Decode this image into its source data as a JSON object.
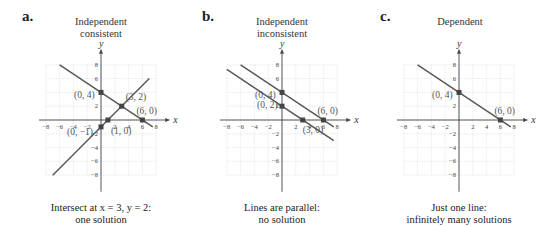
{
  "panels": [
    {
      "letter": "a.",
      "title_lines": [
        "Independent",
        "consistent"
      ],
      "caption_lines": [
        "Intersect at x = 3, y = 2:",
        "one solution"
      ],
      "lines": [
        {
          "equation": "y = -2/3 x + 4",
          "x_from": -6,
          "x_to": 7.5
        },
        {
          "equation": "y = x - 1",
          "x_from": -7,
          "x_to": 7
        }
      ],
      "points": [
        {
          "label": "(0, 4)",
          "x": 0,
          "y": 4
        },
        {
          "label": "(3, 2)",
          "x": 3,
          "y": 2
        },
        {
          "label": "(6, 0)",
          "x": 6,
          "y": 0
        },
        {
          "label": "(0, −1)",
          "x": 0,
          "y": -1
        },
        {
          "label": "(1, 0)",
          "x": 1,
          "y": 0
        }
      ]
    },
    {
      "letter": "b.",
      "title_lines": [
        "Independent",
        "inconsistent"
      ],
      "caption_lines": [
        "Lines are parallel:",
        "no solution"
      ],
      "lines": [
        {
          "equation": "y = -2/3 x + 4",
          "x_from": -6,
          "x_to": 7.5
        },
        {
          "equation": "y = -2/3 x + 2",
          "x_from": -8,
          "x_to": 7.5
        }
      ],
      "points": [
        {
          "label": "(0, 4)",
          "x": 0,
          "y": 4
        },
        {
          "label": "(0, 2)",
          "x": 0,
          "y": 2
        },
        {
          "label": "(6, 0)",
          "x": 6,
          "y": 0
        },
        {
          "label": "(3, 0)",
          "x": 3,
          "y": 0
        }
      ]
    },
    {
      "letter": "c.",
      "title_lines": [
        "Dependent"
      ],
      "caption_lines": [
        "Just one line:",
        "infinitely many solutions"
      ],
      "lines": [
        {
          "equation": "y = -2/3 x + 4",
          "x_from": -6,
          "x_to": 7.5
        }
      ],
      "points": [
        {
          "label": "(0, 4)",
          "x": 0,
          "y": 4
        },
        {
          "label": "(6, 0)",
          "x": 6,
          "y": 0
        }
      ]
    }
  ],
  "axes": {
    "x_label": "x",
    "y_label": "y",
    "x_ticks": [
      "−8",
      "−6",
      "−4",
      "−2",
      "2",
      "4",
      "6",
      "8"
    ],
    "y_ticks": [
      "8",
      "6",
      "2",
      "−2",
      "−4",
      "−6",
      "−8"
    ],
    "range": [
      -8,
      8
    ]
  },
  "colors": {
    "line": "#555555",
    "grid": "#dddddd",
    "axis": "#444444",
    "point": "#444444"
  }
}
